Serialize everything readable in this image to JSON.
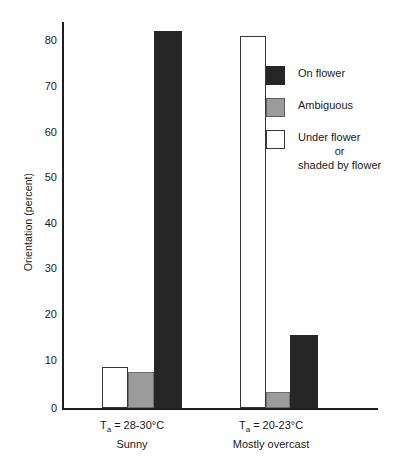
{
  "chart_data": {
    "type": "bar",
    "title": "",
    "xlabel": "",
    "ylabel": "Orientation (percent)",
    "ylim": [
      0,
      85
    ],
    "yticks": [
      0,
      10,
      20,
      30,
      40,
      50,
      60,
      70,
      80
    ],
    "ytick_labels": [
      "0",
      "10",
      "20",
      "30",
      "40",
      "50",
      "60",
      "70",
      "80"
    ],
    "grid": false,
    "legend_position": "upper right",
    "categories": [
      "Ta = 28-30°C / Sunny",
      "Ta = 20-23°C / Mostly overcast"
    ],
    "series": [
      {
        "name": "Under flower or shaded by flower",
        "color": "#ffffff",
        "values": [
          9,
          82
        ]
      },
      {
        "name": "Ambiguous",
        "color": "#9b9b9b",
        "values": [
          8,
          3.5
        ]
      },
      {
        "name": "On flower",
        "color": "#262626",
        "values": [
          83,
          16
        ]
      }
    ]
  },
  "axis": {
    "y_title": "Orientation (percent)",
    "ticks": [
      {
        "label": "80",
        "value": 80
      },
      {
        "label": "70",
        "value": 70
      },
      {
        "label": "60",
        "value": 60
      },
      {
        "label": "50",
        "value": 50
      },
      {
        "label": "40",
        "value": 40
      },
      {
        "label": "30",
        "value": 30
      },
      {
        "label": "20",
        "value": 20
      },
      {
        "label": "10",
        "value": 10
      },
      {
        "label": "0",
        "value": 0
      }
    ]
  },
  "groups": [
    {
      "line1_prefix": "T",
      "line1_sub": "a",
      "line1_rest": " = 28-30°C",
      "line2": "Sunny"
    },
    {
      "line1_prefix": "T",
      "line1_sub": "a",
      "line1_rest": " = 20-23°C",
      "line2": "Mostly overcast"
    }
  ],
  "legend": {
    "items": [
      {
        "swatch": "black",
        "lines": [
          "On flower"
        ]
      },
      {
        "swatch": "gray",
        "lines": [
          "Ambiguous"
        ]
      },
      {
        "swatch": "white",
        "lines": [
          "Under flower",
          "or",
          "shaded by flower"
        ]
      }
    ]
  }
}
